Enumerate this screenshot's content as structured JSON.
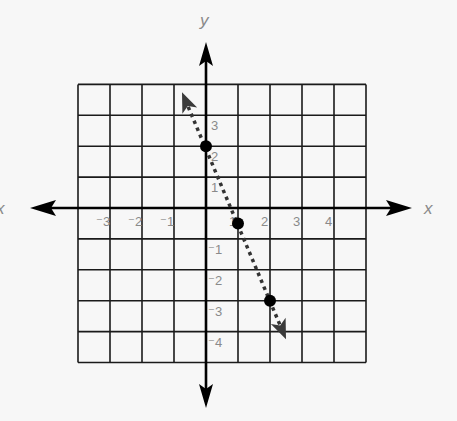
{
  "chart_data": {
    "type": "line",
    "title": "",
    "xlabel": "x",
    "ylabel": "y",
    "xlim": [
      -4,
      5
    ],
    "ylim": [
      -5,
      4
    ],
    "grid": true,
    "x_ticks": [
      {
        "value": -3,
        "label": "⁻3"
      },
      {
        "value": -2,
        "label": "⁻2"
      },
      {
        "value": -1,
        "label": "⁻1"
      },
      {
        "value": 1,
        "label": "1"
      },
      {
        "value": 2,
        "label": "2"
      },
      {
        "value": 3,
        "label": "3"
      },
      {
        "value": 4,
        "label": "4"
      }
    ],
    "y_ticks": [
      {
        "value": 3,
        "label": "3"
      },
      {
        "value": 2,
        "label": "2"
      },
      {
        "value": 1,
        "label": "1"
      },
      {
        "value": -1,
        "label": "⁻1"
      },
      {
        "value": -2,
        "label": "⁻2"
      },
      {
        "value": -3,
        "label": "⁻3"
      },
      {
        "value": -4,
        "label": "⁻4"
      }
    ],
    "series": [
      {
        "name": "dotted line",
        "style": "dotted-with-arrows",
        "equation": "y = -2.5x + 2",
        "arrow_ends": [
          {
            "x": -0.75,
            "y": 3.75
          },
          {
            "x": 2.5,
            "y": -4.25
          }
        ],
        "points": [
          {
            "x": 0,
            "y": 2
          },
          {
            "x": 1,
            "y": -0.5
          },
          {
            "x": 2,
            "y": -3
          }
        ]
      }
    ]
  },
  "axes": {
    "x_label_right": "x",
    "x_label_left": "x",
    "y_label_top": "y"
  },
  "colors": {
    "background": "#f7f7f7",
    "grid": "#1a1a1a",
    "axis": "#000000",
    "label": "#8a8a8a",
    "line": "#333333",
    "point": "#000000"
  }
}
